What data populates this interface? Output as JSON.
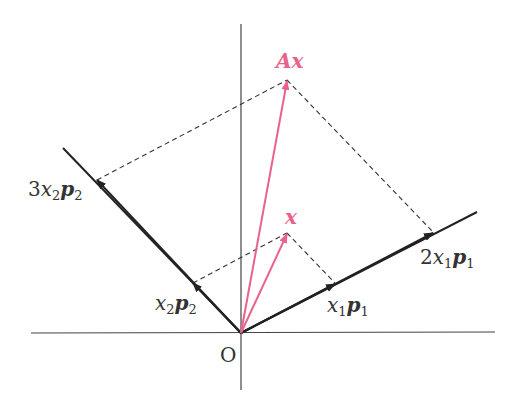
{
  "diagram": {
    "colors": {
      "axis": "#333333",
      "vector": "#222222",
      "pink": "#e8628a",
      "dashed": "#333333"
    },
    "origin_label": "O",
    "labels": {
      "Ax": {
        "a": "A",
        "b": "x"
      },
      "x": "x",
      "x2p2": {
        "coef": "",
        "x": "x",
        "xs": "2",
        "p": "p",
        "ps": "2"
      },
      "x1p1": {
        "coef": "",
        "x": "x",
        "xs": "1",
        "p": "p",
        "ps": "1"
      },
      "3x2p2": {
        "coef": "3",
        "x": "x",
        "xs": "2",
        "p": "p",
        "ps": "2"
      },
      "2x1p1": {
        "coef": "2",
        "x": "x",
        "xs": "1",
        "p": "p",
        "ps": "1"
      }
    }
  }
}
